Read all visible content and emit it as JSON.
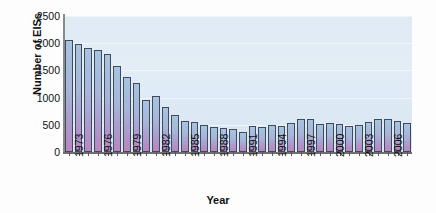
{
  "chart_data": {
    "type": "bar",
    "title": "",
    "xlabel": "Year",
    "ylabel": "Number of EISs",
    "ylim": [
      0,
      2500
    ],
    "yticks": [
      0,
      500,
      1000,
      1500,
      2000,
      2500
    ],
    "ytick_labels": [
      "0",
      "500",
      "1000",
      "1500",
      "2000",
      "2500"
    ],
    "xtick_labels": [
      "1973",
      "1976",
      "1979",
      "1982",
      "1985",
      "1988",
      "1991",
      "1994",
      "1997",
      "2000",
      "2003",
      "2006"
    ],
    "xtick_step": 3,
    "grid": true,
    "legend": null,
    "categories": [
      "1973",
      "1974",
      "1975",
      "1976",
      "1977",
      "1978",
      "1979",
      "1980",
      "1981",
      "1982",
      "1983",
      "1984",
      "1985",
      "1986",
      "1987",
      "1988",
      "1989",
      "1990",
      "1991",
      "1992",
      "1993",
      "1994",
      "1995",
      "1996",
      "1997",
      "1998",
      "1999",
      "2000",
      "2001",
      "2002",
      "2003",
      "2004",
      "2005",
      "2006",
      "2007",
      "2008"
    ],
    "values": [
      2050,
      1990,
      1915,
      1875,
      1810,
      1585,
      1375,
      1275,
      960,
      1030,
      820,
      675,
      575,
      545,
      500,
      460,
      440,
      430,
      370,
      485,
      460,
      505,
      470,
      535,
      600,
      600,
      515,
      525,
      510,
      470,
      490,
      550,
      605,
      610,
      565,
      530
    ],
    "bar_color_top": "#a8c4e0",
    "bar_color_bottom": "#bb86c0",
    "bar_edge_color": "#3f4a5a",
    "panel_color": "#dfeaf4",
    "axis_color": "#6e6e6e",
    "text_color": "#111111"
  }
}
